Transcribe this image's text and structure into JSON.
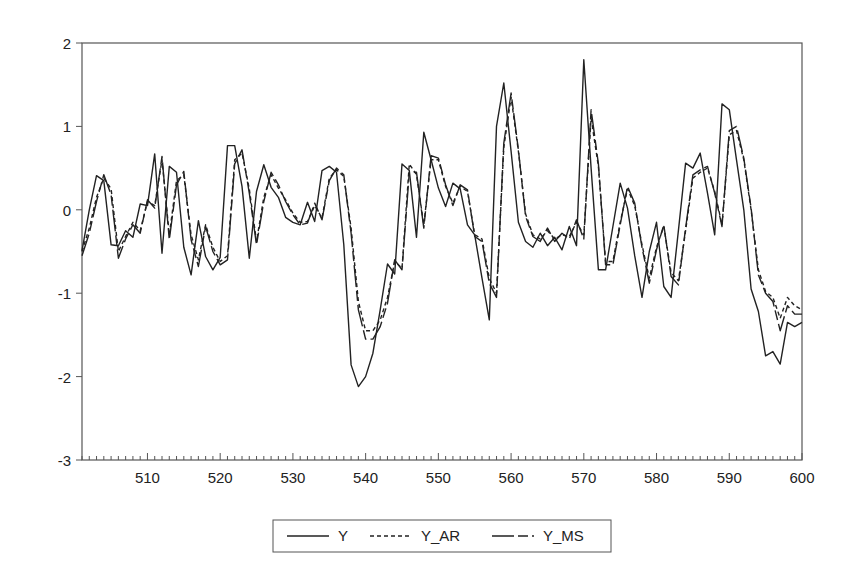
{
  "chart_data": {
    "type": "line",
    "title": "",
    "xlabel": "",
    "ylabel": "",
    "xlim": [
      501,
      600
    ],
    "ylim": [
      -3,
      2
    ],
    "grid": false,
    "legend_position": "bottom",
    "x_ticks": [
      510,
      520,
      530,
      540,
      550,
      560,
      570,
      580,
      590,
      600
    ],
    "y_ticks": [
      -3,
      -2,
      -1,
      0,
      1,
      2
    ],
    "x": [
      501,
      502,
      503,
      504,
      505,
      506,
      507,
      508,
      509,
      510,
      511,
      512,
      513,
      514,
      515,
      516,
      517,
      518,
      519,
      520,
      521,
      522,
      523,
      524,
      525,
      526,
      527,
      528,
      529,
      530,
      531,
      532,
      533,
      534,
      535,
      536,
      537,
      538,
      539,
      540,
      541,
      542,
      543,
      544,
      545,
      546,
      547,
      548,
      549,
      550,
      551,
      552,
      553,
      554,
      555,
      556,
      557,
      558,
      559,
      560,
      561,
      562,
      563,
      564,
      565,
      566,
      567,
      568,
      569,
      570,
      571,
      572,
      573,
      574,
      575,
      576,
      577,
      578,
      579,
      580,
      581,
      582,
      583,
      584,
      585,
      586,
      587,
      588,
      589,
      590,
      591,
      592,
      593,
      594,
      595,
      596,
      597,
      598,
      599,
      600
    ],
    "series": [
      {
        "name": "Y",
        "style": "solid",
        "values": [
          -0.49,
          0.0,
          0.41,
          0.35,
          -0.42,
          -0.43,
          -0.25,
          -0.33,
          0.07,
          0.05,
          0.67,
          -0.52,
          0.52,
          0.45,
          -0.45,
          -0.78,
          -0.13,
          -0.56,
          -0.72,
          -0.57,
          0.77,
          0.77,
          0.28,
          -0.58,
          0.22,
          0.54,
          0.27,
          0.15,
          -0.09,
          -0.15,
          -0.18,
          0.09,
          -0.14,
          0.47,
          0.52,
          0.45,
          -0.42,
          -1.86,
          -2.12,
          -2.0,
          -1.72,
          -1.2,
          -0.65,
          -0.77,
          0.55,
          0.47,
          -0.33,
          0.93,
          0.6,
          0.26,
          0.04,
          0.32,
          0.25,
          -0.18,
          -0.3,
          -0.82,
          -1.32,
          1.0,
          1.52,
          0.7,
          -0.15,
          -0.38,
          -0.45,
          -0.28,
          -0.43,
          -0.33,
          -0.48,
          -0.2,
          -0.43,
          1.8,
          0.5,
          -0.72,
          -0.72,
          -0.2,
          0.32,
          0.02,
          -0.55,
          -1.05,
          -0.5,
          -0.15,
          -0.92,
          -1.05,
          -0.25,
          0.56,
          0.5,
          0.68,
          0.2,
          -0.3,
          1.27,
          1.2,
          0.6,
          0.0,
          -0.95,
          -1.22,
          -1.75,
          -1.7,
          -1.85,
          -1.35,
          -1.4,
          -1.35
        ]
      },
      {
        "name": "Y_AR",
        "style": "dashed",
        "values": [
          -0.5,
          -0.22,
          0.15,
          0.38,
          0.25,
          -0.5,
          -0.32,
          -0.15,
          -0.25,
          0.1,
          0.05,
          0.6,
          -0.3,
          0.35,
          0.42,
          -0.3,
          -0.6,
          -0.18,
          -0.45,
          -0.62,
          -0.55,
          0.6,
          0.68,
          0.25,
          -0.38,
          0.15,
          0.42,
          0.26,
          0.12,
          -0.04,
          -0.15,
          -0.14,
          0.05,
          -0.1,
          0.38,
          0.48,
          0.4,
          -0.22,
          -1.1,
          -1.45,
          -1.45,
          -1.32,
          -1.05,
          -0.62,
          -0.7,
          0.55,
          0.42,
          -0.18,
          0.6,
          0.6,
          0.28,
          0.08,
          0.28,
          0.22,
          -0.3,
          -0.35,
          -0.82,
          -1.0,
          0.75,
          1.35,
          0.7,
          -0.05,
          -0.3,
          -0.35,
          -0.25,
          -0.35,
          -0.3,
          -0.32,
          -0.15,
          -0.3,
          1.1,
          0.52,
          -0.62,
          -0.62,
          -0.15,
          0.25,
          0.05,
          -0.42,
          -0.82,
          -0.45,
          -0.2,
          -0.75,
          -0.85,
          -0.25,
          0.38,
          0.45,
          0.5,
          0.22,
          -0.18,
          0.9,
          0.95,
          0.6,
          0.0,
          -0.72,
          -0.98,
          -1.05,
          -1.3,
          -1.05,
          -1.15,
          -1.2
        ]
      },
      {
        "name": "Y_MS",
        "style": "longdash",
        "values": [
          -0.55,
          -0.28,
          0.1,
          0.42,
          0.18,
          -0.58,
          -0.35,
          -0.18,
          -0.28,
          0.12,
          0.02,
          0.64,
          -0.36,
          0.3,
          0.46,
          -0.36,
          -0.68,
          -0.2,
          -0.5,
          -0.66,
          -0.6,
          0.55,
          0.72,
          0.2,
          -0.42,
          0.1,
          0.45,
          0.3,
          0.1,
          -0.06,
          -0.18,
          -0.16,
          0.08,
          -0.12,
          0.35,
          0.5,
          0.42,
          -0.28,
          -1.2,
          -1.55,
          -1.55,
          -1.4,
          -1.12,
          -0.6,
          -0.72,
          0.45,
          0.45,
          -0.22,
          0.65,
          0.62,
          0.3,
          0.05,
          0.3,
          0.24,
          -0.32,
          -0.38,
          -0.88,
          -1.05,
          0.8,
          1.4,
          0.72,
          -0.08,
          -0.32,
          -0.38,
          -0.22,
          -0.38,
          -0.28,
          -0.35,
          -0.12,
          -0.35,
          1.2,
          0.55,
          -0.66,
          -0.66,
          -0.18,
          0.28,
          0.08,
          -0.45,
          -0.88,
          -0.48,
          -0.18,
          -0.8,
          -0.9,
          -0.22,
          0.42,
          0.48,
          0.52,
          0.2,
          -0.2,
          0.95,
          1.0,
          0.62,
          0.02,
          -0.78,
          -1.0,
          -1.1,
          -1.45,
          -1.15,
          -1.25,
          -1.25
        ]
      }
    ]
  },
  "legend": {
    "items": [
      {
        "label": "Y",
        "style": "solid"
      },
      {
        "label": "Y_AR",
        "style": "dashed"
      },
      {
        "label": "Y_MS",
        "style": "longdash"
      }
    ]
  }
}
